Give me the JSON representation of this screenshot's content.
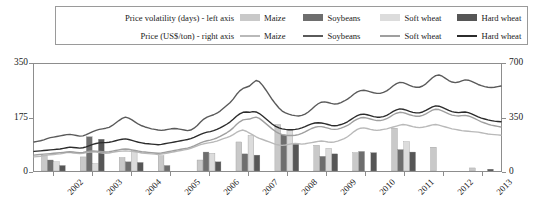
{
  "legend": {
    "row1_title": "Price volatility (days) - left axis",
    "row2_title": "Price (US$/ton) - right axis",
    "items": [
      "Maize",
      "Soybeans",
      "Soft wheat",
      "Hard wheat"
    ],
    "bar_colors": [
      "#c9c9c9",
      "#6e6e6e",
      "#dcdcdc",
      "#565656"
    ],
    "line_colors": [
      "#b9b9b9",
      "#5a5a5a",
      "#9f9f9f",
      "#2c2c2c"
    ]
  },
  "chart_data": {
    "type": "bar",
    "title": "",
    "subtitle": "",
    "xlabel": "",
    "ylabel": "Price volatility (days)",
    "y2label": "Price (US$/ton)",
    "grid": false,
    "legend_position": "top",
    "categories": [
      "2002",
      "2003",
      "2004",
      "2005",
      "2006",
      "2007",
      "2008",
      "2009",
      "2010",
      "2011",
      "2012",
      "2013"
    ],
    "yticks": [
      0,
      175,
      350
    ],
    "ylim": [
      0,
      350
    ],
    "y2ticks": [
      0,
      350,
      700
    ],
    "y2lim": [
      0,
      700
    ],
    "bar_series": [
      {
        "name": "Maize",
        "color": "#c9c9c9",
        "values": [
          52,
          46,
          44,
          50,
          36,
          95,
          152,
          84,
          60,
          140,
          78,
          10
        ]
      },
      {
        "name": "Soybeans",
        "color": "#6e6e6e",
        "values": [
          36,
          112,
          30,
          18,
          62,
          56,
          118,
          48,
          64,
          70,
          0,
          0
        ]
      },
      {
        "name": "Soft wheat",
        "color": "#dcdcdc",
        "values": [
          30,
          24,
          66,
          0,
          58,
          116,
          134,
          74,
          0,
          96,
          0,
          0
        ]
      },
      {
        "name": "Hard wheat",
        "color": "#565656",
        "values": [
          18,
          104,
          28,
          0,
          30,
          52,
          88,
          56,
          60,
          62,
          0,
          6
        ]
      }
    ],
    "line_series": [
      {
        "name": "Maize",
        "color": "#b9b9b9",
        "values": [
          92,
          94,
          96,
          100,
          104,
          106,
          108,
          110,
          112,
          116,
          120,
          122,
          118,
          116,
          114,
          116,
          120,
          124,
          126,
          124,
          120,
          118,
          116,
          118,
          122,
          126,
          128,
          130,
          132,
          130,
          128,
          126,
          122,
          118,
          116,
          114,
          112,
          110,
          108,
          110,
          114,
          118,
          122,
          126,
          130,
          134,
          138,
          142,
          148,
          156,
          164,
          172,
          178,
          182,
          186,
          190,
          196,
          204,
          212,
          218,
          226,
          238,
          252,
          262,
          268,
          260,
          248,
          236,
          224,
          214,
          206,
          198,
          190,
          182,
          174,
          170,
          168,
          170,
          174,
          178,
          180,
          178,
          176,
          178,
          182,
          186,
          190,
          194,
          196,
          194,
          190,
          188,
          190,
          196,
          204,
          212,
          224,
          240,
          258,
          272,
          280,
          282,
          278,
          272,
          268,
          266,
          268,
          272,
          276,
          282,
          288,
          294,
          300,
          304,
          302,
          296,
          290,
          286,
          284,
          286,
          290,
          296,
          302,
          304,
          300,
          294,
          288,
          282,
          276,
          272,
          268,
          264,
          262,
          260,
          258,
          256,
          254,
          250,
          246,
          242,
          240,
          238,
          236,
          234
        ]
      },
      {
        "name": "Soybeans",
        "color": "#5a5a5a",
        "values": [
          190,
          194,
          198,
          204,
          212,
          218,
          222,
          226,
          230,
          234,
          238,
          240,
          236,
          232,
          228,
          230,
          238,
          248,
          258,
          266,
          272,
          276,
          280,
          286,
          298,
          314,
          330,
          344,
          352,
          346,
          334,
          320,
          306,
          296,
          288,
          282,
          276,
          272,
          268,
          266,
          268,
          272,
          276,
          278,
          276,
          272,
          268,
          264,
          268,
          280,
          298,
          320,
          340,
          352,
          360,
          368,
          378,
          392,
          410,
          428,
          446,
          470,
          500,
          524,
          540,
          548,
          556,
          576,
          592,
          584,
          560,
          530,
          498,
          466,
          438,
          412,
          392,
          380,
          372,
          366,
          362,
          360,
          364,
          372,
          386,
          404,
          424,
          440,
          450,
          452,
          448,
          442,
          438,
          440,
          448,
          458,
          470,
          486,
          504,
          518,
          526,
          528,
          524,
          518,
          512,
          508,
          508,
          514,
          524,
          540,
          558,
          572,
          580,
          578,
          570,
          560,
          552,
          548,
          548,
          556,
          570,
          590,
          610,
          624,
          628,
          620,
          606,
          592,
          582,
          578,
          582,
          590,
          596,
          594,
          586,
          576,
          566,
          558,
          552,
          548,
          546,
          548,
          552,
          556
        ]
      },
      {
        "name": "Soft wheat",
        "color": "#9f9f9f",
        "values": [
          104,
          106,
          108,
          110,
          112,
          114,
          116,
          118,
          120,
          122,
          124,
          126,
          124,
          122,
          120,
          122,
          126,
          130,
          132,
          130,
          128,
          126,
          124,
          126,
          130,
          134,
          138,
          142,
          144,
          142,
          138,
          134,
          130,
          126,
          124,
          122,
          120,
          118,
          116,
          118,
          122,
          126,
          130,
          134,
          138,
          142,
          146,
          150,
          156,
          164,
          174,
          184,
          192,
          198,
          202,
          208,
          216,
          226,
          238,
          250,
          264,
          282,
          304,
          322,
          334,
          338,
          340,
          348,
          352,
          344,
          328,
          310,
          292,
          274,
          258,
          246,
          238,
          234,
          232,
          232,
          234,
          238,
          246,
          256,
          268,
          278,
          286,
          290,
          290,
          286,
          280,
          274,
          272,
          274,
          280,
          288,
          298,
          312,
          328,
          340,
          348,
          350,
          346,
          340,
          334,
          330,
          330,
          334,
          342,
          354,
          368,
          378,
          384,
          382,
          376,
          368,
          362,
          358,
          358,
          364,
          374,
          386,
          398,
          404,
          402,
          394,
          384,
          374,
          366,
          362,
          360,
          362,
          364,
          360,
          352,
          342,
          332,
          322,
          314,
          306,
          300,
          296,
          292,
          288
        ]
      },
      {
        "name": "Hard wheat",
        "color": "#2c2c2c",
        "values": [
          128,
          130,
          132,
          134,
          136,
          138,
          140,
          142,
          144,
          148,
          152,
          156,
          154,
          152,
          150,
          152,
          158,
          166,
          174,
          180,
          184,
          186,
          186,
          188,
          192,
          198,
          204,
          208,
          210,
          206,
          200,
          194,
          188,
          184,
          180,
          178,
          176,
          174,
          172,
          174,
          178,
          182,
          186,
          190,
          194,
          198,
          202,
          206,
          212,
          220,
          230,
          240,
          248,
          254,
          258,
          264,
          272,
          282,
          294,
          306,
          320,
          338,
          358,
          374,
          384,
          386,
          384,
          388,
          386,
          376,
          360,
          342,
          324,
          306,
          292,
          282,
          276,
          272,
          270,
          270,
          272,
          276,
          282,
          290,
          300,
          308,
          314,
          316,
          314,
          310,
          304,
          298,
          296,
          298,
          304,
          312,
          322,
          336,
          350,
          362,
          370,
          372,
          368,
          362,
          356,
          352,
          352,
          356,
          364,
          376,
          390,
          400,
          406,
          404,
          398,
          390,
          384,
          380,
          380,
          386,
          396,
          408,
          420,
          426,
          424,
          416,
          406,
          396,
          388,
          384,
          382,
          384,
          386,
          382,
          374,
          364,
          354,
          346,
          340,
          334,
          330,
          326,
          324,
          322
        ]
      }
    ]
  }
}
